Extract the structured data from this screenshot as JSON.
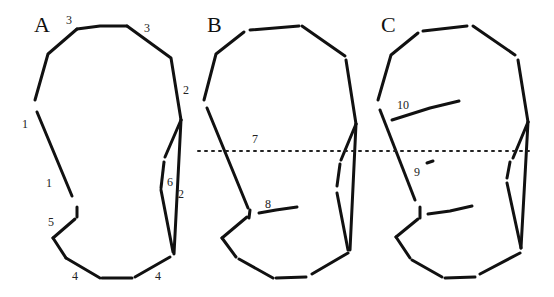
{
  "figure": {
    "panels": [
      {
        "id": "A",
        "label": "A",
        "label_pos": [
          34,
          14
        ],
        "segments": [
          [
            [
              77,
              29
            ],
            [
              48,
              54
            ],
            [
              35,
              100
            ]
          ],
          [
            [
              77,
              29
            ],
            [
              100,
              26
            ],
            [
              127,
              26
            ]
          ],
          [
            [
              127,
              26
            ],
            [
              171,
              58
            ],
            [
              181,
              120
            ]
          ],
          [
            [
              37,
              112
            ],
            [
              72,
              196
            ]
          ],
          [
            [
              77,
              207
            ],
            [
              77,
              217
            ]
          ],
          [
            [
              75,
              219
            ],
            [
              53,
              238
            ]
          ],
          [
            [
              53,
              238
            ],
            [
              66,
              258
            ]
          ],
          [
            [
              66,
              258
            ],
            [
              100,
              278
            ]
          ],
          [
            [
              102,
              278
            ],
            [
              132,
              278
            ]
          ],
          [
            [
              135,
              277
            ],
            [
              170,
              257
            ]
          ],
          [
            [
              174,
              254
            ],
            [
              181,
              120
            ]
          ],
          [
            [
              181,
              120
            ],
            [
              165,
              157
            ]
          ],
          [
            [
              164,
              162
            ],
            [
              161,
              188
            ]
          ],
          [
            [
              161,
              190
            ],
            [
              173,
              252
            ]
          ]
        ],
        "numbers": [
          {
            "text": "3",
            "pos": [
              66,
              14
            ]
          },
          {
            "text": "3",
            "pos": [
              144,
              22
            ]
          },
          {
            "text": "2",
            "pos": [
              183,
              84
            ]
          },
          {
            "text": "1",
            "pos": [
              22,
              118
            ]
          },
          {
            "text": "1",
            "pos": [
              46,
              177
            ]
          },
          {
            "text": "6",
            "pos": [
              167,
              176
            ]
          },
          {
            "text": "2",
            "pos": [
              178,
              188
            ]
          },
          {
            "text": "5",
            "pos": [
              48,
              216
            ]
          },
          {
            "text": "4",
            "pos": [
              72,
              270
            ]
          },
          {
            "text": "4",
            "pos": [
              155,
              270
            ]
          }
        ]
      },
      {
        "id": "B",
        "label": "B",
        "label_pos": [
          207,
          14
        ],
        "segments": [
          [
            [
              244,
              32
            ],
            [
              216,
              54
            ],
            [
              204,
              100
            ]
          ],
          [
            [
              250,
              30
            ],
            [
              299,
              26
            ]
          ],
          [
            [
              302,
              26
            ],
            [
              345,
              56
            ]
          ],
          [
            [
              346,
              60
            ],
            [
              356,
              124
            ]
          ],
          [
            [
              207,
              108
            ],
            [
              248,
              208
            ]
          ],
          [
            [
              250,
              210
            ],
            [
              249,
              218
            ]
          ],
          [
            [
              247,
              217
            ],
            [
              222,
              238
            ]
          ],
          [
            [
              222,
              238
            ],
            [
              236,
              257
            ]
          ],
          [
            [
              239,
              259
            ],
            [
              273,
              278
            ]
          ],
          [
            [
              276,
              278
            ],
            [
              306,
              277
            ]
          ],
          [
            [
              312,
              274
            ],
            [
              348,
              253
            ]
          ],
          [
            [
              350,
              250
            ],
            [
              356,
              124
            ]
          ],
          [
            [
              356,
              124
            ],
            [
              341,
              160
            ]
          ],
          [
            [
              340,
              164
            ],
            [
              337,
              186
            ]
          ],
          [
            [
              337,
              193
            ],
            [
              348,
              250
            ]
          ],
          [
            [
              259,
              213
            ],
            [
              276,
              210
            ],
            [
              297,
              207
            ]
          ]
        ],
        "numbers": [
          {
            "text": "7",
            "pos": [
              252,
              133
            ]
          },
          {
            "text": "8",
            "pos": [
              265,
              198
            ]
          }
        ]
      },
      {
        "id": "C",
        "label": "C",
        "label_pos": [
          381,
          14
        ],
        "segments": [
          [
            [
              418,
              33
            ],
            [
              391,
              55
            ],
            [
              378,
              100
            ]
          ],
          [
            [
              423,
              31
            ],
            [
              467,
              26
            ]
          ],
          [
            [
              473,
              26
            ],
            [
              515,
              55
            ]
          ],
          [
            [
              518,
              60
            ],
            [
              528,
              122
            ]
          ],
          [
            [
              380,
              110
            ],
            [
              415,
              200
            ]
          ],
          [
            [
              420,
              207
            ],
            [
              420,
              218
            ]
          ],
          [
            [
              418,
              219
            ],
            [
              396,
              237
            ]
          ],
          [
            [
              396,
              237
            ],
            [
              410,
              258
            ]
          ],
          [
            [
              412,
              260
            ],
            [
              442,
              277
            ]
          ],
          [
            [
              445,
              278
            ],
            [
              475,
              277
            ]
          ],
          [
            [
              480,
              274
            ],
            [
              520,
              253
            ]
          ],
          [
            [
              521,
              248
            ],
            [
              528,
              122
            ]
          ],
          [
            [
              528,
              122
            ],
            [
              513,
              158
            ]
          ],
          [
            [
              510,
              162
            ],
            [
              507,
              178
            ]
          ],
          [
            [
              507,
              183
            ],
            [
              521,
              248
            ]
          ],
          [
            [
              428,
              214
            ],
            [
              450,
              211
            ],
            [
              472,
              206
            ]
          ],
          [
            [
              392,
              120
            ],
            [
              430,
              108
            ],
            [
              459,
              101
            ]
          ],
          [
            [
              427,
              163
            ],
            [
              433,
              161
            ]
          ]
        ],
        "numbers": [
          {
            "text": "10",
            "pos": [
              397,
              99
            ]
          },
          {
            "text": "9",
            "pos": [
              414,
              166
            ]
          }
        ]
      }
    ],
    "dotted_line": {
      "y": 151,
      "x_start": 198,
      "x_end": 530
    },
    "stroke_color": "#111111",
    "background_color": "#ffffff"
  }
}
